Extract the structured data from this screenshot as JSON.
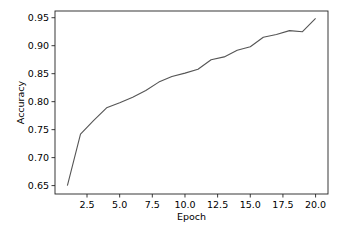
{
  "chart_data": {
    "type": "line",
    "title": "",
    "xlabel": "Epoch",
    "ylabel": "Accuracy",
    "xlim": [
      0.05,
      20.95
    ],
    "ylim": [
      0.635,
      0.962
    ],
    "grid": false,
    "legend": null,
    "x_ticks": [
      2.5,
      5.0,
      7.5,
      10.0,
      12.5,
      15.0,
      17.5,
      20.0
    ],
    "x_tick_labels": [
      "2.5",
      "5.0",
      "7.5",
      "10.0",
      "12.5",
      "15.0",
      "17.5",
      "20.0"
    ],
    "y_ticks": [
      0.65,
      0.7,
      0.75,
      0.8,
      0.85,
      0.9,
      0.95
    ],
    "y_tick_labels": [
      "0.65",
      "0.70",
      "0.75",
      "0.80",
      "0.85",
      "0.90",
      "0.95"
    ],
    "series": [
      {
        "name": "Accuracy",
        "color": "#555555",
        "x": [
          1,
          2,
          3,
          4,
          5,
          6,
          7,
          8,
          9,
          10,
          11,
          12,
          13,
          14,
          15,
          16,
          17,
          18,
          19,
          20
        ],
        "values": [
          0.65,
          0.742,
          0.766,
          0.789,
          0.798,
          0.808,
          0.82,
          0.835,
          0.845,
          0.851,
          0.858,
          0.875,
          0.88,
          0.892,
          0.898,
          0.915,
          0.92,
          0.927,
          0.925,
          0.949
        ]
      }
    ]
  },
  "layout": {
    "plot_left": 55,
    "plot_right": 328,
    "plot_top": 11,
    "plot_bottom": 194
  }
}
